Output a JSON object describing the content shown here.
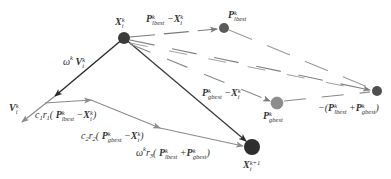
{
  "diagram": {
    "type": "pso-velocity-update-vector-diagram",
    "nodes": [
      {
        "id": "x_current",
        "label_base": "X",
        "label_sup": "k",
        "label_sub": "i",
        "color": "#3a3a3a",
        "cx": 124,
        "cy": 38,
        "r": 6
      },
      {
        "id": "p_lbest",
        "label_base": "P",
        "label_sup": "k",
        "label_sub": "lbest",
        "color": "#5a5a5a",
        "cx": 224,
        "cy": 28,
        "r": 5
      },
      {
        "id": "p_gbest",
        "label_base": "P",
        "label_sup": "k",
        "label_sub": "gbest",
        "color": "#8a8a8a",
        "cx": 277,
        "cy": 103,
        "r": 6
      },
      {
        "id": "neg_sum",
        "label": "-(P^k_lbest + P^k_gbest)",
        "color": "#505050",
        "cx": 377,
        "cy": 91,
        "r": 5
      },
      {
        "id": "x_next",
        "label_base": "X",
        "label_sup": "k+1",
        "label_sub": "i",
        "color": "#2e2e2e",
        "cx": 252,
        "cy": 147,
        "r": 8
      }
    ],
    "labels": {
      "x_current": {
        "base": "X",
        "sup": "k",
        "sub": "i"
      },
      "p_lbest_minus_x": {
        "p": "P",
        "p_sup": "k",
        "p_sub": "lbest",
        "op": "−",
        "x": "X",
        "x_sup": "k",
        "x_sub": "i"
      },
      "p_lbest": {
        "base": "P",
        "sup": "k",
        "sub": "lbest"
      },
      "inertia": {
        "omega": "ω",
        "omega_sup": "k",
        "v": "V",
        "v_sup": "k",
        "v_sub": "i"
      },
      "v_current": {
        "base": "V",
        "sup": "k",
        "sub": "i"
      },
      "cognitive": {
        "coef": "c",
        "coef_sub": "1",
        "r": "r",
        "r_sub": "1",
        "open": "(",
        "p": "P",
        "p_sup": "k",
        "p_sub": "lbest",
        "op": "−",
        "x": "X",
        "x_sup": "k",
        "x_sub": "i",
        "close": ")"
      },
      "social": {
        "coef": "c",
        "coef_sub": "2",
        "r": "r",
        "r_sub": "2",
        "open": "(",
        "p": "P",
        "p_sup": "k",
        "p_sub": "gbest",
        "op": "−",
        "x": "X",
        "x_sup": "k",
        "x_sub": "i",
        "close": ")"
      },
      "third": {
        "omega": "ω",
        "omega_sup": "k",
        "r": "r",
        "r_sub": "3",
        "open": "(",
        "p1": "P",
        "p1_sup": "k",
        "p1_sub": "lbest",
        "op": "+",
        "p2": "P",
        "p2_sup": "k",
        "p2_sub": "gbest",
        "close": ")"
      },
      "p_gbest_minus_x": {
        "p": "P",
        "p_sup": "k",
        "p_sub": "gbest",
        "op": "−",
        "x": "X",
        "x_sup": "k",
        "x_sub": "i"
      },
      "p_gbest": {
        "base": "P",
        "sup": "k",
        "sub": "gbest"
      },
      "neg_sum": {
        "prefix": "−(",
        "p1": "P",
        "p1_sup": "k",
        "p1_sub": "lbest",
        "op": "+",
        "p2": "P",
        "p2_sup": "k",
        "p2_sub": "gbest",
        "close": ")"
      },
      "x_next": {
        "base": "X",
        "sup": "k+1",
        "sub": "i"
      }
    },
    "colors": {
      "dark_line": "#3a3a3a",
      "gray_line": "#8c8c8c",
      "dash_line": "#909090"
    }
  }
}
